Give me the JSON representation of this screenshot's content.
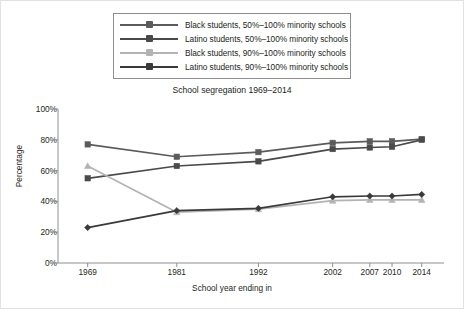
{
  "figure": {
    "width": 464,
    "height": 309,
    "background": "#ffffff",
    "border_color": "#e2e2e2"
  },
  "legend": {
    "position": "top-center",
    "border_color": "#8f8f8f",
    "entries": [
      {
        "label": "Black students, 50%–100% minority schools",
        "color": "#5b5b5b",
        "marker": "square"
      },
      {
        "label": "Latino students, 50%–100% minority schools",
        "color": "#4a4a4a",
        "marker": "square"
      },
      {
        "label": "Black students, 90%–100% minority schools",
        "color": "#b3b3b3",
        "marker": "triangle"
      },
      {
        "label": "Latino students, 90%–100% minority schools",
        "color": "#3a3a3a",
        "marker": "diamond"
      }
    ]
  },
  "axes": {
    "axis_color": "#8f8f8f",
    "tick_color": "#8f8f8f",
    "y_ticks": [
      "100%",
      "80%",
      "60%",
      "40%",
      "20%",
      "0%"
    ],
    "x_ticks": [
      "1969",
      "1981",
      "1992",
      "2002",
      "2007",
      "2010",
      "2014"
    ]
  },
  "chart_data": {
    "type": "line",
    "title": "School segregation 1969–2014",
    "xlabel": "School year ending in",
    "ylabel": "Percentage",
    "x": [
      1969,
      1981,
      1992,
      2002,
      2007,
      2010,
      2014
    ],
    "xlim": [
      1965,
      2017
    ],
    "ylim": [
      0,
      100
    ],
    "ytick_values": [
      100,
      80,
      60,
      40,
      20,
      0
    ],
    "grid": false,
    "legend_position": "top-center",
    "series": [
      {
        "name": "Black students, 50%–100% minority schools",
        "color": "#5b5b5b",
        "marker": "square",
        "values": [
          77,
          69,
          72,
          78,
          79,
          79,
          80.5
        ]
      },
      {
        "name": "Latino students, 50%–100% minority schools",
        "color": "#4a4a4a",
        "marker": "square",
        "values": [
          55,
          63,
          66,
          74,
          75,
          75.5,
          80
        ]
      },
      {
        "name": "Black students, 90%–100% minority schools",
        "color": "#b3b3b3",
        "marker": "triangle",
        "values": [
          63,
          33,
          35,
          40.5,
          41,
          41,
          41
        ]
      },
      {
        "name": "Latino students, 90%–100% minority schools",
        "color": "#3a3a3a",
        "marker": "diamond",
        "values": [
          23,
          34,
          35.5,
          43,
          43.5,
          43.5,
          44.5
        ]
      }
    ]
  }
}
